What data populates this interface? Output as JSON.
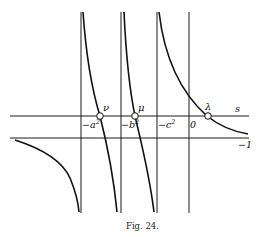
{
  "figure": {
    "caption": "Fig. 24.",
    "axis_labels": {
      "horizontal": "s",
      "lower_line": "−1"
    },
    "vertical_lines": [
      {
        "label": "−a",
        "sup": "2"
      },
      {
        "label": "−b",
        "sup": "2"
      },
      {
        "label": "−c",
        "sup": "2"
      },
      {
        "label": "0",
        "sup": ""
      }
    ],
    "roots": [
      {
        "name": "ν"
      },
      {
        "name": "μ"
      },
      {
        "name": "λ"
      }
    ]
  }
}
